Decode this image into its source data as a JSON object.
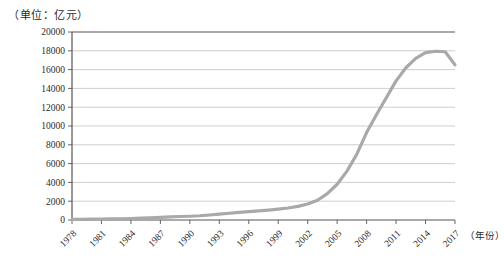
{
  "axis_unit_note": "（单位：亿元）",
  "xaxis_title": "（年份）",
  "colors": {
    "line": "#a9a9a9",
    "gridline": "#b9b9b9",
    "axis": "#555555",
    "text": "#2b2b2b",
    "background": "#ffffff"
  },
  "chart_data": {
    "type": "line",
    "title": "",
    "subtitle": "",
    "xlabel": "（年份）",
    "ylabel": "（单位：亿元）",
    "grid": true,
    "legend": null,
    "xlim": [
      1978,
      2017
    ],
    "ylim": [
      0,
      20000
    ],
    "ytick_step": 2000,
    "ytick_labels": [
      "0",
      "2000",
      "4000",
      "6000",
      "8000",
      "10000",
      "12000",
      "14000",
      "16000",
      "18000",
      "20000"
    ],
    "ytick_values": [
      0,
      2000,
      4000,
      6000,
      8000,
      10000,
      12000,
      14000,
      16000,
      18000,
      20000
    ],
    "xtick_labels": [
      "1978",
      "1981",
      "1984",
      "1987",
      "1990",
      "1993",
      "1996",
      "1999",
      "2002",
      "2005",
      "2008",
      "2011",
      "2014",
      "2017"
    ],
    "xtick_values": [
      1978,
      1981,
      1984,
      1987,
      1990,
      1993,
      1996,
      1999,
      2002,
      2005,
      2008,
      2011,
      2014,
      2017
    ],
    "series": [
      {
        "name": "",
        "color": "#a9a9a9",
        "x": [
          1978,
          1979,
          1980,
          1981,
          1982,
          1983,
          1984,
          1985,
          1986,
          1987,
          1988,
          1989,
          1990,
          1991,
          1992,
          1993,
          1994,
          1995,
          1996,
          1997,
          1998,
          1999,
          2000,
          2001,
          2002,
          2003,
          2004,
          2005,
          2006,
          2007,
          2008,
          2009,
          2010,
          2011,
          2012,
          2013,
          2014,
          2015,
          2016,
          2017
        ],
        "values": [
          60,
          70,
          85,
          100,
          115,
          130,
          160,
          200,
          230,
          270,
          330,
          370,
          400,
          450,
          530,
          620,
          720,
          820,
          900,
          980,
          1060,
          1160,
          1280,
          1450,
          1700,
          2100,
          2800,
          3800,
          5200,
          7000,
          9300,
          11200,
          13000,
          14800,
          16200,
          17200,
          17800,
          17950,
          17900,
          16500
        ]
      }
    ]
  }
}
